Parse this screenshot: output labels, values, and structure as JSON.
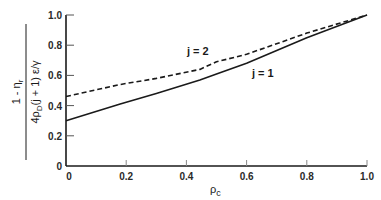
{
  "chart_data": {
    "type": "line",
    "title": "",
    "xlabel": "ρ_c",
    "ylabel": "(1 − η_r) / (4ρ_D(j + 1) ε/γ)",
    "ylabel_parts": {
      "numerator": "1 - η",
      "numerator_sub": "r",
      "denominator_prefix": "4ρ",
      "denominator_sub": "D",
      "denominator_rest": "(j + 1) ε/γ"
    },
    "xlim": [
      0,
      1.0
    ],
    "ylim": [
      0,
      1.0
    ],
    "x_ticks": [
      "0",
      "0.2",
      "0.4",
      "0.6",
      "0.8",
      "1.0"
    ],
    "y_ticks": [
      "0",
      "0.2",
      "0.4",
      "0.6",
      "0.8",
      "1.0"
    ],
    "grid": false,
    "legend": "inline curve labels",
    "series": [
      {
        "name": "j = 1",
        "style": "solid",
        "x": [
          0,
          0.18,
          0.3,
          0.445,
          0.5,
          0.6,
          0.8,
          1.0
        ],
        "y": [
          0.3,
          0.41,
          0.48,
          0.57,
          0.61,
          0.68,
          0.85,
          1.0
        ]
      },
      {
        "name": "j = 2",
        "style": "dashed",
        "x": [
          0,
          0.18,
          0.3,
          0.445,
          0.5,
          0.6,
          0.8,
          1.0
        ],
        "y": [
          0.46,
          0.54,
          0.58,
          0.64,
          0.69,
          0.74,
          0.88,
          1.0
        ]
      }
    ],
    "annotations": [
      {
        "text": "j = 2",
        "near_x": 0.45,
        "near_y": 0.74
      },
      {
        "text": "j = 1",
        "near_x": 0.65,
        "near_y": 0.62
      }
    ]
  },
  "labels": {
    "x_axis_symbol": "ρ",
    "x_axis_sub": "c",
    "j1": "j = 1",
    "j2": "j = 2"
  },
  "colors": {
    "ink": "#1a1a1a",
    "background": "#ffffff"
  }
}
